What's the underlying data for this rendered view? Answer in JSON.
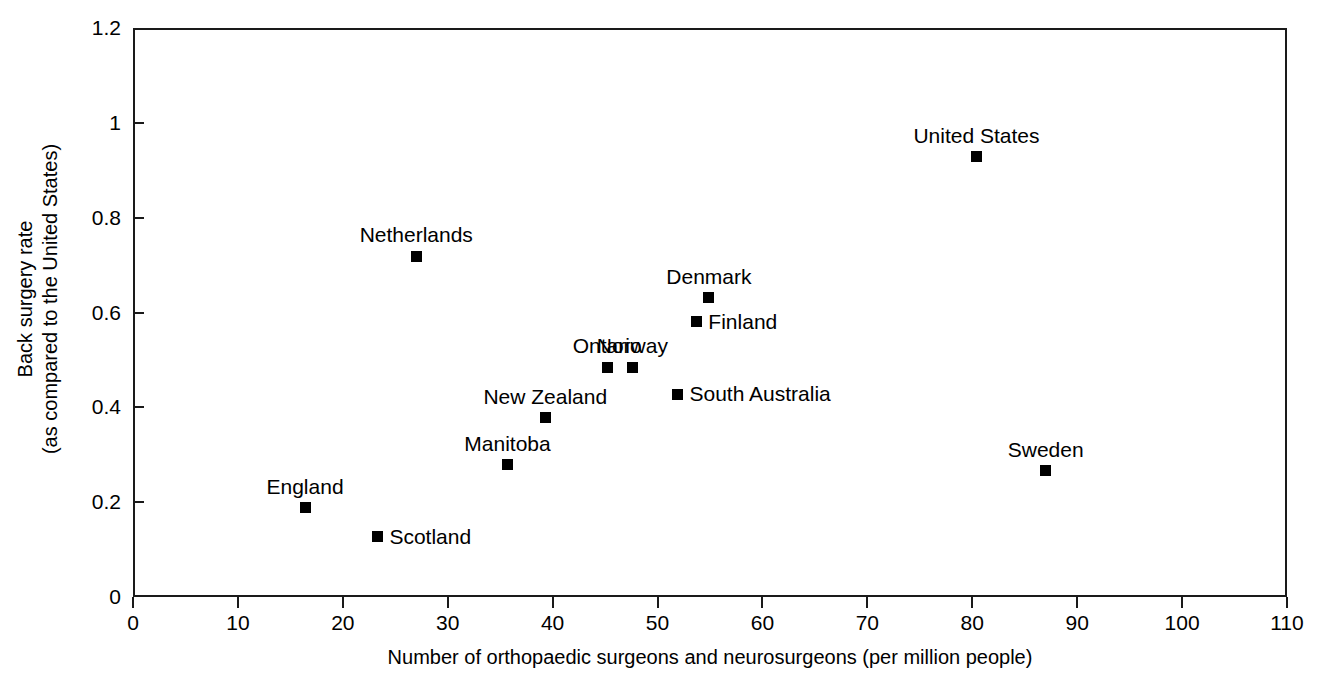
{
  "chart_data": {
    "type": "scatter",
    "title": "",
    "subtitle": "",
    "xlabel": "Number of orthopaedic surgeons and neurosurgeons (per million people)",
    "ylabel_lines": [
      "Back surgery rate",
      "(as compared to the United States)"
    ],
    "xlim": [
      0,
      110
    ],
    "ylim": [
      0,
      1.2
    ],
    "xticks": [
      0,
      10,
      20,
      30,
      40,
      50,
      60,
      70,
      80,
      90,
      100,
      110
    ],
    "xticklabels": [
      "0",
      "10",
      "20",
      "30",
      "40",
      "50",
      "60",
      "70",
      "80",
      "90",
      "100",
      "110"
    ],
    "yticks": [
      0,
      0.2,
      0.4,
      0.6,
      0.8,
      1,
      1.2
    ],
    "yticklabels": [
      "0",
      "0.2",
      "0.4",
      "0.6",
      "0.8",
      "1",
      "1.2"
    ],
    "grid": false,
    "legend": "none",
    "marker_style": "filled-square",
    "marker_color": "#000000",
    "points": [
      {
        "label": "Scotland",
        "x": 23.3,
        "y": 0.127,
        "label_pos": "right"
      },
      {
        "label": "England",
        "x": 16.4,
        "y": 0.188,
        "label_pos": "above"
      },
      {
        "label": "Sweden",
        "x": 87.0,
        "y": 0.266,
        "label_pos": "above"
      },
      {
        "label": "Manitoba",
        "x": 35.7,
        "y": 0.279,
        "label_pos": "above"
      },
      {
        "label": "New Zealand",
        "x": 39.3,
        "y": 0.378,
        "label_pos": "above"
      },
      {
        "label": "South Australia",
        "x": 51.9,
        "y": 0.428,
        "label_pos": "right"
      },
      {
        "label": "Ontario",
        "x": 45.2,
        "y": 0.485,
        "label_pos": "above"
      },
      {
        "label": "Norway",
        "x": 47.6,
        "y": 0.485,
        "label_pos": "above"
      },
      {
        "label": "Finland",
        "x": 53.7,
        "y": 0.58,
        "label_pos": "right"
      },
      {
        "label": "Denmark",
        "x": 54.9,
        "y": 0.631,
        "label_pos": "above"
      },
      {
        "label": "Netherlands",
        "x": 27.0,
        "y": 0.719,
        "label_pos": "above"
      },
      {
        "label": "United States",
        "x": 80.4,
        "y": 0.928,
        "label_pos": "above"
      }
    ]
  }
}
